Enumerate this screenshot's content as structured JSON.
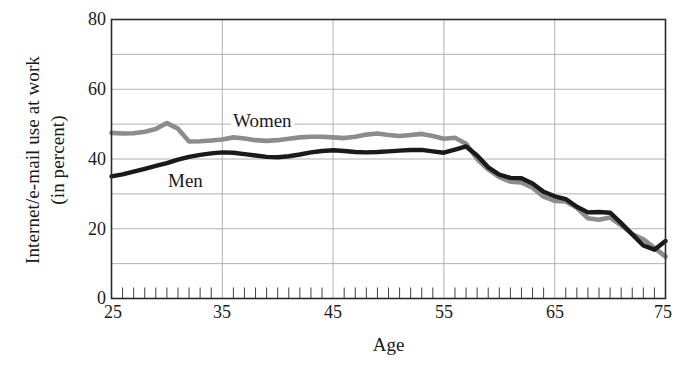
{
  "chart_data": {
    "type": "line",
    "title": "",
    "xlabel": "Age",
    "ylabel": "Internet/e-mail use at work (in percent)",
    "ylabel_line1": "Internet/e-mail use at work",
    "ylabel_line2": "(in percent)",
    "xlim": [
      25,
      75
    ],
    "ylim": [
      0,
      80
    ],
    "xticks": [
      25,
      35,
      45,
      55,
      65,
      75
    ],
    "yticks": [
      0,
      20,
      40,
      60,
      80
    ],
    "gridlines_y": [
      10,
      20,
      30,
      40,
      50,
      60,
      70
    ],
    "gridlines_x": [
      35,
      45,
      55,
      65
    ],
    "minor_tick_step": 1,
    "grid": true,
    "legend_position": "inline-annotation",
    "x": [
      25,
      26,
      27,
      28,
      29,
      30,
      31,
      32,
      33,
      34,
      35,
      36,
      37,
      38,
      39,
      40,
      41,
      42,
      43,
      44,
      45,
      46,
      47,
      48,
      49,
      50,
      51,
      52,
      53,
      54,
      55,
      56,
      57,
      58,
      59,
      60,
      61,
      62,
      63,
      64,
      65,
      66,
      67,
      68,
      69,
      70,
      71,
      72,
      73,
      74,
      75
    ],
    "series": [
      {
        "name": "Women",
        "color": "#8c8c8c",
        "values": [
          47.5,
          47.3,
          47.4,
          47.8,
          48.6,
          50.3,
          48.7,
          45.0,
          45.1,
          45.3,
          45.6,
          46.2,
          45.9,
          45.4,
          45.2,
          45.4,
          45.8,
          46.2,
          46.4,
          46.4,
          46.2,
          46.0,
          46.4,
          47.0,
          47.3,
          46.9,
          46.6,
          46.9,
          47.2,
          46.6,
          45.8,
          46.1,
          44.4,
          40.0,
          37.0,
          34.8,
          33.5,
          33.3,
          31.8,
          29.2,
          28.0,
          27.8,
          26.0,
          23.0,
          22.6,
          23.2,
          21.0,
          18.5,
          17.0,
          14.5,
          12.0
        ]
      },
      {
        "name": "Men",
        "color": "#1a1a1a",
        "values": [
          35.0,
          35.6,
          36.4,
          37.2,
          38.0,
          38.8,
          39.8,
          40.6,
          41.2,
          41.6,
          41.9,
          41.8,
          41.4,
          41.0,
          40.6,
          40.5,
          40.8,
          41.3,
          41.9,
          42.3,
          42.5,
          42.3,
          42.0,
          41.9,
          42.0,
          42.2,
          42.4,
          42.6,
          42.6,
          42.2,
          41.8,
          42.7,
          43.6,
          41.0,
          37.6,
          35.5,
          34.6,
          34.5,
          33.0,
          30.6,
          29.3,
          28.5,
          26.3,
          24.7,
          24.8,
          24.6,
          21.6,
          18.4,
          15.2,
          14.0,
          16.5
        ]
      }
    ],
    "annotations": [
      {
        "text": "Women",
        "series": "Women"
      },
      {
        "text": "Men",
        "series": "Men"
      }
    ]
  },
  "axis": {
    "y_tick_labels": [
      "80",
      "60",
      "40",
      "20",
      "0"
    ],
    "x_tick_labels": [
      "25",
      "35",
      "45",
      "55",
      "65",
      "75"
    ],
    "x_title": "Age",
    "y_title_line1": "Internet/e-mail use at work",
    "y_title_line2": "(in percent)"
  },
  "colors": {
    "women": "#8c8c8c",
    "men": "#1a1a1a",
    "frame": "#2b2b2b",
    "grid": "#a9a9a9",
    "background": "#ffffff"
  }
}
